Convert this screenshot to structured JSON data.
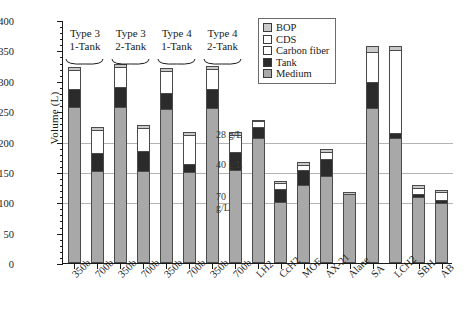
{
  "chart_data": {
    "type": "bar",
    "stacked": true,
    "title": "",
    "xlabel": "",
    "ylabel": "Volume (L)",
    "ylim": [
      0,
      400
    ],
    "ytick_step": 50,
    "yticks": [
      0,
      50,
      100,
      150,
      200,
      250,
      300,
      350,
      400
    ],
    "grid": "horizontal",
    "gridlines_at": [
      100,
      150,
      200
    ],
    "legend_position": "top-right",
    "legend": [
      "BOP",
      "CDS",
      "Carbon fiber",
      "Tank",
      "Medium"
    ],
    "categories": [
      "350b",
      "700b",
      "350b",
      "700b",
      "350b",
      "700b",
      "350b",
      "700b",
      "LH2",
      "CcH2",
      "MOF",
      "AX-21",
      "Alane",
      "SA",
      "LCH2",
      "SBH",
      "AB"
    ],
    "series": [
      {
        "name": "Medium",
        "values": [
          256,
          150,
          256,
          150,
          252,
          148,
          255,
          152,
          205,
          100,
          128,
          143,
          113,
          254,
          205,
          108,
          98
        ]
      },
      {
        "name": "Tank",
        "values": [
          30,
          31,
          34,
          33,
          27,
          15,
          31,
          30,
          18,
          22,
          25,
          28,
          0,
          44,
          7,
          6,
          6
        ]
      },
      {
        "name": "Carbon fiber",
        "values": [
          32,
          38,
          32,
          39,
          37,
          47,
          34,
          29,
          11,
          9,
          8,
          12,
          0,
          50,
          139,
          10,
          12
        ]
      },
      {
        "name": "CDS",
        "values": [
          0,
          0,
          0,
          0,
          0,
          0,
          0,
          0,
          0,
          0,
          0,
          0,
          0,
          0,
          0,
          0,
          0
        ]
      },
      {
        "name": "BOP",
        "values": [
          5,
          5,
          5,
          5,
          5,
          5,
          5,
          5,
          2,
          4,
          5,
          5,
          4,
          9,
          7,
          5,
          5
        ]
      }
    ],
    "group_titles": [
      {
        "line1": "Type 3",
        "line2": "1-Tank",
        "spans": [
          0,
          1
        ]
      },
      {
        "line1": "Type 3",
        "line2": "2-Tank",
        "spans": [
          2,
          3
        ]
      },
      {
        "line1": "Type 4",
        "line2": "1-Tank",
        "spans": [
          4,
          5
        ]
      },
      {
        "line1": "Type 4",
        "line2": "2-Tank",
        "spans": [
          6,
          7
        ]
      }
    ],
    "annotations": [
      {
        "text": "28 g/L",
        "y": 200
      },
      {
        "text": "40 g/L",
        "y": 150
      },
      {
        "text": "70 g/L",
        "y": 100
      }
    ],
    "colors": {
      "medium": "#a8a8a8",
      "tank": "#2b2b2b",
      "carbon_fiber": "#ffffff",
      "cds": "#ffffff",
      "bop": "#c9c9c9",
      "gridline": "#b4b4b4",
      "axis": "#1a1a1a"
    }
  }
}
